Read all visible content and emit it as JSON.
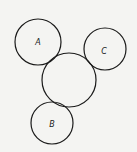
{
  "diagram": {
    "circles": [
      {
        "id": "A",
        "label": "A",
        "cx": 38,
        "cy": 42,
        "r": 23
      },
      {
        "id": "C",
        "label": "C",
        "cx": 105,
        "cy": 49,
        "r": 21
      },
      {
        "id": "center",
        "label": "",
        "cx": 69,
        "cy": 80,
        "r": 27
      },
      {
        "id": "B",
        "label": "B",
        "cx": 52,
        "cy": 123,
        "r": 21
      }
    ],
    "labels": {
      "a": "A",
      "b": "B",
      "c": "C"
    }
  }
}
